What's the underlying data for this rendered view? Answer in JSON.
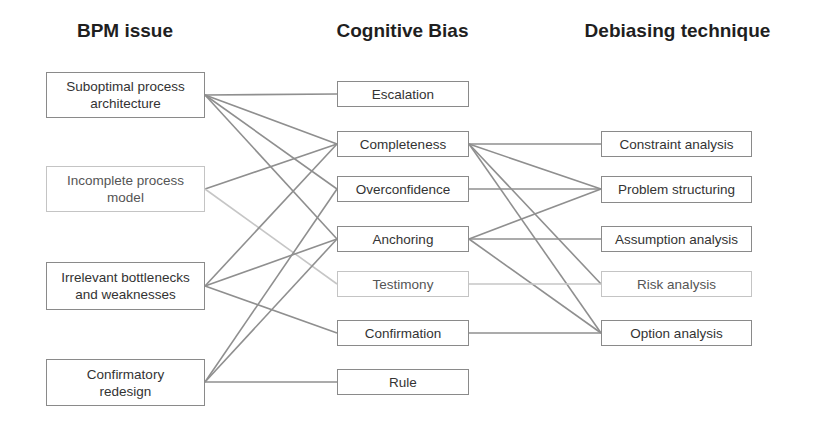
{
  "headers": {
    "bpm_issue": "BPM issue",
    "cognitive_bias": "Cognitive Bias",
    "debiasing_technique": "Debiasing technique"
  },
  "columns": {
    "bpm_issues": [
      {
        "id": "suboptimal",
        "label": "Suboptimal process architecture",
        "line1": "Suboptimal process",
        "line2": "architecture",
        "light": false
      },
      {
        "id": "incomplete",
        "label": "Incomplete process model",
        "line1": "Incomplete process",
        "line2": "model",
        "light": true
      },
      {
        "id": "irrelevant",
        "label": "Irrelevant bottlenecks and weaknesses",
        "line1": "Irrelevant bottlenecks",
        "line2": "and weaknesses",
        "light": false
      },
      {
        "id": "confirmatory",
        "label": "Confirmatory redesign",
        "line1": "Confirmatory",
        "line2": "redesign",
        "light": false
      }
    ],
    "cognitive_biases": [
      {
        "id": "escalation",
        "label": "Escalation",
        "light": false
      },
      {
        "id": "completeness",
        "label": "Completeness",
        "light": false
      },
      {
        "id": "overconfidence",
        "label": "Overconfidence",
        "light": false
      },
      {
        "id": "anchoring",
        "label": "Anchoring",
        "light": false
      },
      {
        "id": "testimony",
        "label": "Testimony",
        "light": true
      },
      {
        "id": "confirmation",
        "label": "Confirmation",
        "light": false
      },
      {
        "id": "rule",
        "label": "Rule",
        "light": false
      }
    ],
    "debiasing_techniques": [
      {
        "id": "constraint",
        "label": "Constraint analysis",
        "light": false
      },
      {
        "id": "problem",
        "label": "Problem structuring",
        "light": false
      },
      {
        "id": "assumption",
        "label": "Assumption analysis",
        "light": false
      },
      {
        "id": "risk",
        "label": "Risk analysis",
        "light": true
      },
      {
        "id": "option",
        "label": "Option analysis",
        "light": false
      }
    ]
  },
  "links": {
    "issue_to_bias": [
      [
        "suboptimal",
        "escalation"
      ],
      [
        "suboptimal",
        "completeness"
      ],
      [
        "suboptimal",
        "overconfidence"
      ],
      [
        "suboptimal",
        "anchoring"
      ],
      [
        "incomplete",
        "completeness"
      ],
      [
        "incomplete",
        "testimony"
      ],
      [
        "irrelevant",
        "completeness"
      ],
      [
        "irrelevant",
        "anchoring"
      ],
      [
        "irrelevant",
        "confirmation"
      ],
      [
        "confirmatory",
        "overconfidence"
      ],
      [
        "confirmatory",
        "anchoring"
      ],
      [
        "confirmatory",
        "rule"
      ]
    ],
    "bias_to_technique": [
      [
        "completeness",
        "constraint"
      ],
      [
        "completeness",
        "problem"
      ],
      [
        "completeness",
        "risk"
      ],
      [
        "completeness",
        "option"
      ],
      [
        "overconfidence",
        "problem"
      ],
      [
        "anchoring",
        "problem"
      ],
      [
        "anchoring",
        "assumption"
      ],
      [
        "anchoring",
        "option"
      ],
      [
        "testimony",
        "risk"
      ],
      [
        "confirmation",
        "option"
      ]
    ]
  },
  "colors": {
    "line": "#8f8f8f",
    "line_light": "#c6c6c6",
    "border": "#8a8a8a",
    "border_light": "#c4c4c4",
    "text": "#333333",
    "header": "#1f1f1f"
  }
}
